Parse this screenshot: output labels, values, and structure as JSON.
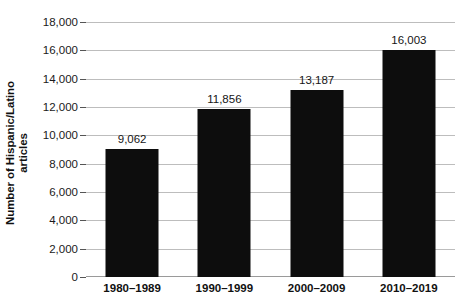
{
  "chart_data": {
    "type": "bar",
    "title": "",
    "xlabel": "",
    "ylabel": "Number of Hispanic/Latino articles",
    "ylabel_lines": [
      "Number of Hispanic/Latino",
      "articles"
    ],
    "categories": [
      "1980–1989",
      "1990–1999",
      "2000–2009",
      "2010–2019"
    ],
    "values": [
      9062,
      11856,
      13187,
      16003
    ],
    "value_labels": [
      "9,062",
      "11,856",
      "13,187",
      "16,003"
    ],
    "ylim": [
      0,
      18000
    ],
    "ytick_values": [
      0,
      2000,
      4000,
      6000,
      8000,
      10000,
      12000,
      14000,
      16000,
      18000
    ],
    "ytick_labels": [
      "0",
      "2,000",
      "4,000",
      "6,000",
      "8,000",
      "10,000",
      "12,000",
      "14,000",
      "16,000",
      "18,000"
    ],
    "grid": true,
    "legend": "none",
    "bar_color": "#0d0d0d",
    "gridline_color": "#bdbdbd",
    "background_color": "#ffffff"
  }
}
